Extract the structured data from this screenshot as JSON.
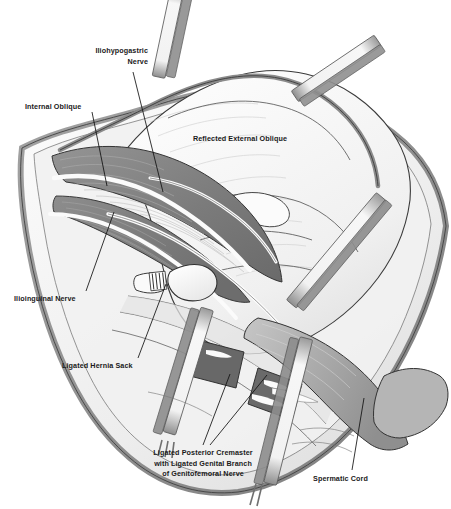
{
  "figure": {
    "palette": {
      "background": "#ffffff",
      "outline": "#2b2b2b",
      "label_text": "#1a1a1a",
      "leader_line": "#111111",
      "muscle_dark": "#6f6f6f",
      "muscle_mid": "#8a8a8a",
      "muscle_light": "#b9b9b9",
      "fascia_pale": "#e9e9e9",
      "fascia_white": "#fafafa",
      "tissue_shadow": "#9a9a9a",
      "retractor_tape": "#f4f4f4",
      "retractor_edge": "#8e8e8e",
      "cremaster_block": "#6b6b6b",
      "cord_gray": "#a8a8a8"
    }
  },
  "labels": [
    {
      "id": "iliohypogastric-nerve",
      "text": "Iliohypogastric\nNerve",
      "align": "right",
      "x": 148,
      "y": 46,
      "leader": {
        "x1": 133,
        "y1": 72,
        "x2": 163,
        "y2": 192
      }
    },
    {
      "id": "internal-oblique",
      "text": "Internal Oblique",
      "align": "left",
      "x": 25,
      "y": 102,
      "leader": {
        "x1": 92,
        "y1": 112,
        "x2": 107,
        "y2": 186
      }
    },
    {
      "id": "reflected-external-oblique",
      "text": "Reflected External Oblique",
      "align": "center",
      "x": 240,
      "y": 134,
      "leader": null
    },
    {
      "id": "ilioinguinal-nerve",
      "text": "Ilioinguinal Nerve",
      "align": "left",
      "x": 14,
      "y": 294,
      "leader": {
        "x1": 86,
        "y1": 291,
        "x2": 114,
        "y2": 212
      }
    },
    {
      "id": "ligated-hernia-sack",
      "text": "Ligated Hernia Sack",
      "align": "left",
      "x": 62,
      "y": 361,
      "leader": {
        "x1": 138,
        "y1": 358,
        "x2": 166,
        "y2": 284
      }
    },
    {
      "id": "ligated-posterior-cremaster",
      "text": "Ligated Posterior Cremaster\nwith Ligated Genital Branch\nof Genitofemoral Nerve",
      "align": "center",
      "x": 203,
      "y": 448,
      "leader": {
        "x1": 203,
        "y1": 445,
        "x2": 230,
        "y2": 374
      },
      "leader2": {
        "x1": 210,
        "y1": 445,
        "x2": 267,
        "y2": 375
      }
    },
    {
      "id": "spermatic-cord",
      "text": "Spermatic Cord",
      "align": "left",
      "x": 313,
      "y": 474,
      "leader": {
        "x1": 352,
        "y1": 470,
        "x2": 364,
        "y2": 398
      }
    }
  ],
  "anatomy": {
    "structures": [
      "Reflected external oblique aponeurosis",
      "Internal oblique muscle",
      "Iliohypogastric nerve",
      "Ilioinguinal nerve",
      "Ligated hernia sack",
      "Ligated posterior cremaster with ligated genital branch of genitofemoral nerve",
      "Spermatic cord"
    ],
    "retractor_tape_count": 5,
    "cremaster_block_count": 2
  }
}
